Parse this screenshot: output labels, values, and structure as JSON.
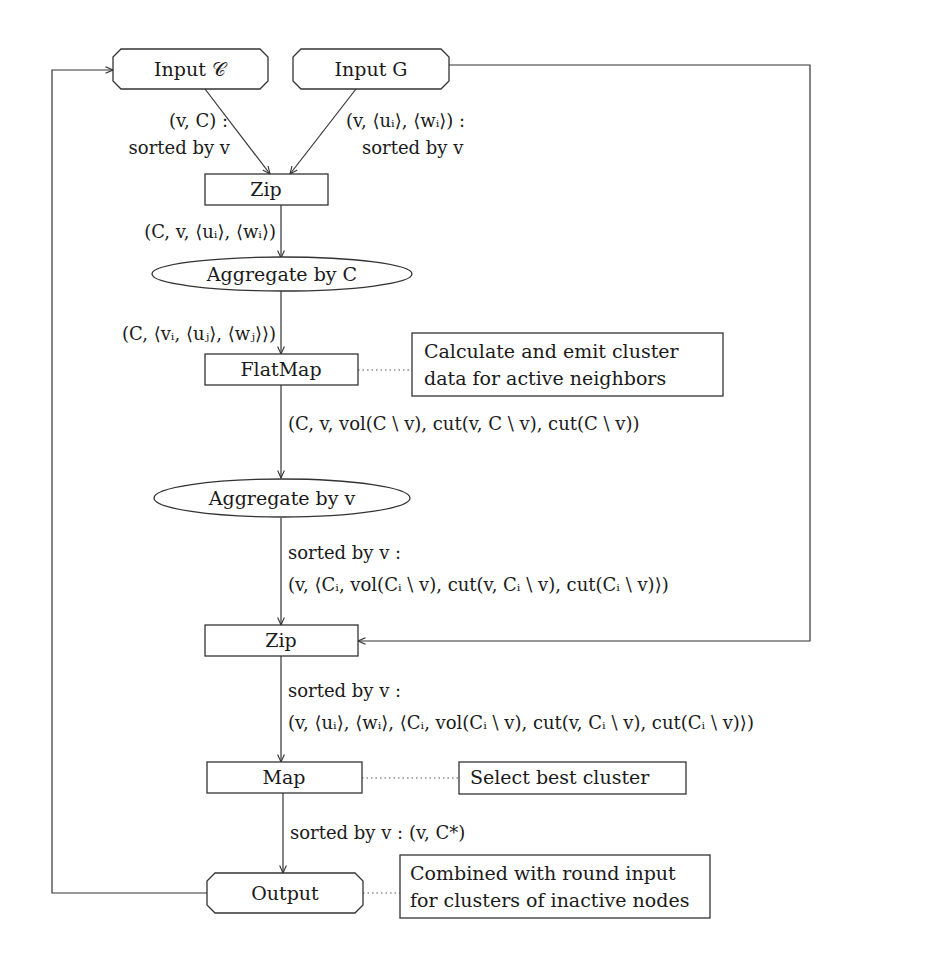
{
  "figure": {
    "type": "dataflow-diagram",
    "colors": {
      "stroke": "#333333",
      "text": "#1a1a1a",
      "background": "#ffffff"
    }
  },
  "nodes": {
    "input_c": {
      "label": "Input 𝒞",
      "shape": "octagon"
    },
    "input_g": {
      "label": "Input G",
      "shape": "octagon"
    },
    "zip_1": {
      "label": "Zip",
      "shape": "rectangle"
    },
    "aggregate_c": {
      "label": "Aggregate by C",
      "shape": "ellipse"
    },
    "flatmap": {
      "label": "FlatMap",
      "shape": "rectangle"
    },
    "aggregate_v": {
      "label": "Aggregate by v",
      "shape": "ellipse"
    },
    "zip_2": {
      "label": "Zip",
      "shape": "rectangle"
    },
    "map": {
      "label": "Map",
      "shape": "rectangle"
    },
    "output": {
      "label": "Output",
      "shape": "octagon"
    }
  },
  "annotations": {
    "flatmap_note": {
      "lines": [
        "Calculate and emit cluster",
        "data for active neighbors"
      ]
    },
    "map_note": {
      "lines": [
        "Select best cluster"
      ]
    },
    "output_note": {
      "lines": [
        "Combined with round input",
        "for clusters of inactive nodes"
      ]
    }
  },
  "edges": {
    "input_c_to_zip": {
      "lines": [
        "(v, C) :",
        "sorted by v"
      ]
    },
    "input_g_to_zip": {
      "lines": [
        "(v, ⟨uᵢ⟩, ⟨wᵢ⟩) :",
        "sorted by v"
      ]
    },
    "zip_to_aggregate_c": {
      "lines": [
        "(C, v, ⟨uᵢ⟩, ⟨wᵢ⟩)"
      ]
    },
    "aggregate_c_to_flatmap": {
      "lines": [
        "(C, ⟨vᵢ, ⟨uⱼ⟩, ⟨wⱼ⟩⟩)"
      ]
    },
    "flatmap_to_aggregate_v": {
      "lines": [
        "(C, v, vol(C \\ v), cut(v, C \\ v), cut(C \\ v))"
      ]
    },
    "aggregate_v_to_zip": {
      "lines": [
        "sorted by v :",
        "(v, ⟨Cᵢ, vol(Cᵢ \\ v), cut(v, Cᵢ \\ v), cut(Cᵢ \\ v)⟩)"
      ]
    },
    "zip_to_map": {
      "lines": [
        "sorted by v :",
        "(v, ⟨uᵢ⟩, ⟨wᵢ⟩, ⟨Cᵢ, vol(Cᵢ \\ v), cut(v, Cᵢ \\ v), cut(Cᵢ \\ v)⟩)"
      ]
    },
    "map_to_output": {
      "lines": [
        "sorted by v : (v, C*)"
      ]
    },
    "input_g_to_zip_2": {
      "lines": []
    },
    "output_to_input_c": {
      "lines": []
    }
  }
}
